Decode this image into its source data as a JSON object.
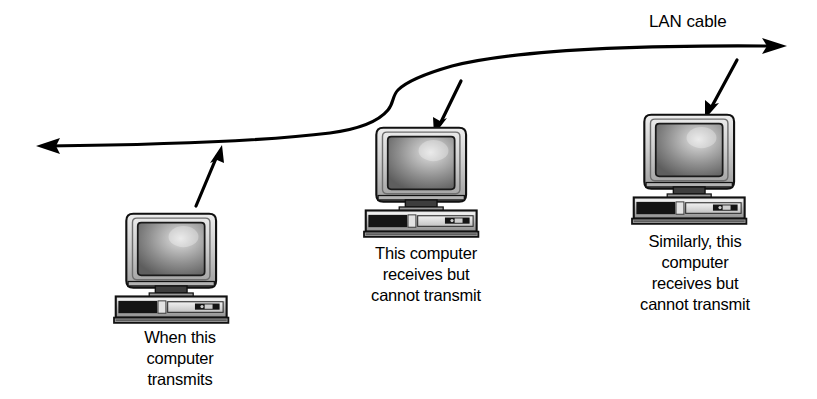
{
  "diagram": {
    "type": "network-topology",
    "background_color": "#ffffff",
    "line_color": "#000000",
    "cable": {
      "label": "LAN cable",
      "description": "Horizontal bus cable with arrowheads at both ends and an S-shaped kink near the middle",
      "left_arrow_direction": "left",
      "right_arrow_direction": "right"
    },
    "nodes": [
      {
        "id": "computer-left",
        "icon": "desktop-computer-icon",
        "role": "transmitter",
        "caption_lines": [
          "When this",
          "computer",
          "transmits"
        ],
        "pointer_arrow": {
          "name": "pointer-arrow-left",
          "direction": "up-right",
          "from_node_to_cable": true
        }
      },
      {
        "id": "computer-middle",
        "icon": "desktop-computer-icon",
        "role": "receiver",
        "caption_lines": [
          "This computer",
          "receives but",
          "cannot transmit"
        ],
        "pointer_arrow": {
          "name": "pointer-arrow-middle",
          "direction": "down-left",
          "from_node_to_cable": false
        }
      },
      {
        "id": "computer-right",
        "icon": "desktop-computer-icon",
        "role": "receiver",
        "caption_lines": [
          "Similarly, this",
          "computer",
          "receives but",
          "cannot transmit"
        ],
        "pointer_arrow": {
          "name": "pointer-arrow-right",
          "direction": "down-left",
          "from_node_to_cable": false
        }
      }
    ],
    "colors": {
      "ink": "#000000",
      "case_light": "#d8d8d8",
      "case_mid": "#a8a8a8",
      "case_dark": "#4a4a4a",
      "case_black": "#151515",
      "screen_dark": "#646464",
      "screen_light": "#d2d2d2",
      "bezel": "#c9c9c9",
      "paper": "#ffffff"
    }
  }
}
